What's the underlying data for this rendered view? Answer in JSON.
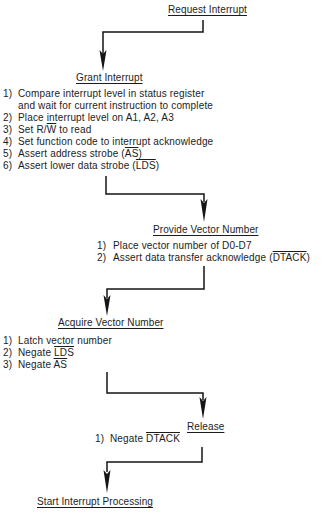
{
  "colors": {
    "ink": "#1c1c1c",
    "background": "#ffffff"
  },
  "steps": [
    {
      "title": "Request Interrupt",
      "items": []
    },
    {
      "title": "Grant Interrupt",
      "items": [
        {
          "num": "1)",
          "text": "Compare interrupt level in status register",
          "cont": "and wait for current instruction to complete"
        },
        {
          "num": "2)",
          "text": "Place interrupt level on A1, A2, A3"
        },
        {
          "num": "3)",
          "pre": "Set R/",
          "over": "W",
          "post": " to read"
        },
        {
          "num": "4)",
          "text": "Set function code to interrupt acknowledge"
        },
        {
          "num": "5)",
          "pre": "Assert address strobe (",
          "over": "AS",
          "post": ")"
        },
        {
          "num": "6)",
          "pre": "Assert lower data strobe (",
          "over": "LDS",
          "post": ")"
        }
      ]
    },
    {
      "title": "Provide Vector Number",
      "items": [
        {
          "num": "1)",
          "text": "Place vector number of D0-D7"
        },
        {
          "num": "2)",
          "pre": "Assert data transfer acknowledge (",
          "over": "DTACK",
          "post": ")"
        }
      ]
    },
    {
      "title": "Acquire Vector Number",
      "items": [
        {
          "num": "1)",
          "text": "Latch vector number"
        },
        {
          "num": "2)",
          "pre": "Negate ",
          "over": "LDS"
        },
        {
          "num": "3)",
          "pre": "Negate ",
          "over": "AS"
        }
      ]
    },
    {
      "title": "Release",
      "items": [
        {
          "num": "1)",
          "pre": "Negate ",
          "over": "DTACK"
        }
      ]
    },
    {
      "title": "Start Interrupt Processing",
      "items": []
    }
  ]
}
